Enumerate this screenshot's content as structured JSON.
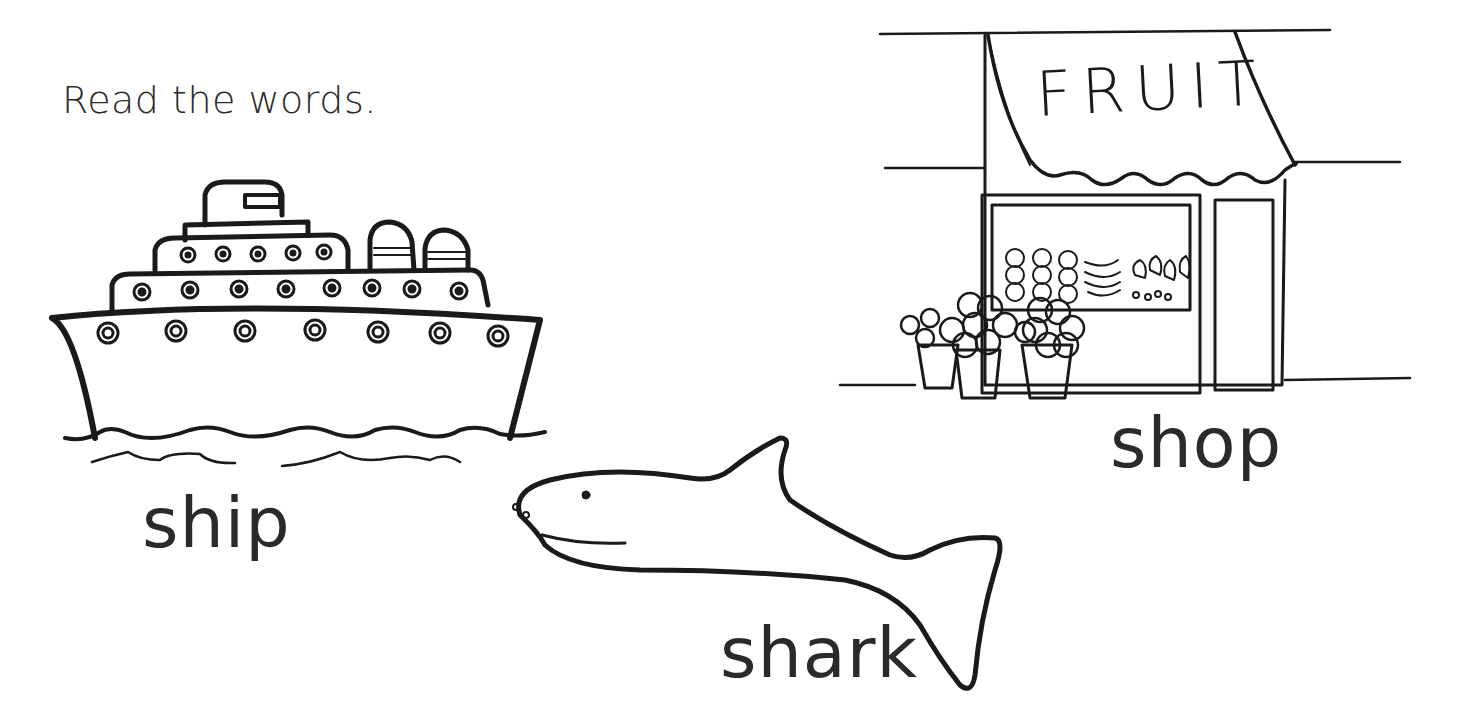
{
  "worksheet": {
    "instruction": "Read the words.",
    "items": [
      {
        "word": "ship",
        "picture": "cruise-ship"
      },
      {
        "word": "shark",
        "picture": "shark"
      },
      {
        "word": "shop",
        "picture": "fruit-shop"
      }
    ],
    "shop_sign": "FRUIT",
    "colors": {
      "ink": "#1a1a1a",
      "text": "#2a2a2a",
      "background": "#ffffff"
    }
  }
}
